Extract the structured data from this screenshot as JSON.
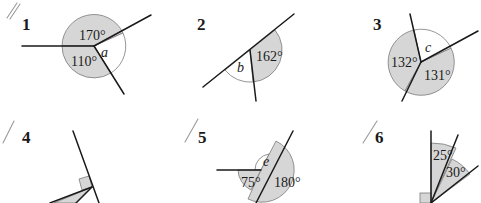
{
  "colors": {
    "shade": "#d6d6d6",
    "ink": "#1a1a1a",
    "outline": "#7a7a7a",
    "pencil": "#9a9a9a"
  },
  "problems": [
    {
      "number": "1",
      "angles": [
        {
          "label": "170°",
          "shaded": true
        },
        {
          "label": "110°",
          "shaded": true
        },
        {
          "label": "a",
          "unknown": true,
          "shaded": false
        }
      ]
    },
    {
      "number": "2",
      "angles": [
        {
          "label": "162°",
          "shaded": true
        },
        {
          "label": "b",
          "unknown": true,
          "shaded": false
        }
      ]
    },
    {
      "number": "3",
      "angles": [
        {
          "label": "c",
          "unknown": true,
          "shaded": false
        },
        {
          "label": "132°",
          "shaded": true
        },
        {
          "label": "131°",
          "shaded": true
        }
      ]
    },
    {
      "number": "4",
      "angles": [
        {
          "label": "right-angle",
          "shaded": true
        },
        {
          "label": "d",
          "unknown": true,
          "shaded": true
        }
      ]
    },
    {
      "number": "5",
      "angles": [
        {
          "label": "e",
          "unknown": true,
          "shaded": false
        },
        {
          "label": "75°",
          "shaded": true
        },
        {
          "label": "180°",
          "shaded": true
        }
      ]
    },
    {
      "number": "6",
      "angles": [
        {
          "label": "25°",
          "shaded": true
        },
        {
          "label": "30°",
          "shaded": true
        },
        {
          "label": "right-angle",
          "shaded": true
        }
      ]
    }
  ]
}
